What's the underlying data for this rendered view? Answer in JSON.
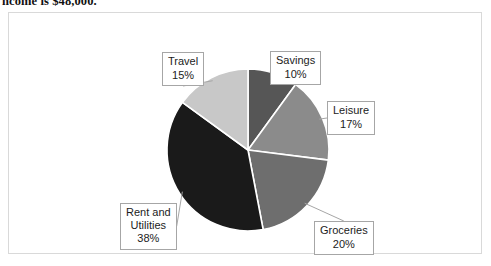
{
  "caption": {
    "text": "ncome is $48,000."
  },
  "figure": {
    "border_color": "#d9d9d9",
    "background": "#ffffff"
  },
  "chart_data": {
    "type": "pie",
    "title": "",
    "xlabel": "",
    "ylabel": "",
    "legend_position": "none",
    "grid": false,
    "start_angle_deg": 0,
    "direction": "clockwise",
    "units": "percent",
    "categories": [
      "Savings",
      "Leisure",
      "Groceries",
      "Rent and Utilities",
      "Travel"
    ],
    "values": [
      10,
      17,
      20,
      38,
      15
    ],
    "colors": [
      "#565656",
      "#8b8b8b",
      "#6e6e6e",
      "#1a1a1a",
      "#c8c8c8"
    ],
    "slices": [
      {
        "name": "Savings",
        "label_line1": "Savings",
        "label_line2": "10%",
        "value": 10,
        "color": "#565656",
        "start_deg": 0,
        "end_deg": 36
      },
      {
        "name": "Leisure",
        "label_line1": "Leisure",
        "label_line2": "17%",
        "value": 17,
        "color": "#8b8b8b",
        "start_deg": 36,
        "end_deg": 97.2
      },
      {
        "name": "Groceries",
        "label_line1": "Groceries",
        "label_line2": "20%",
        "value": 20,
        "color": "#6e6e6e",
        "start_deg": 97.2,
        "end_deg": 169.2
      },
      {
        "name": "Rent and Utilities",
        "label_line1": "Rent and",
        "label_line2": "Utilities",
        "label_line3": "38%",
        "value": 38,
        "color": "#1a1a1a",
        "start_deg": 169.2,
        "end_deg": 306
      },
      {
        "name": "Travel",
        "label_line1": "Travel",
        "label_line2": "15%",
        "value": 15,
        "color": "#c8c8c8",
        "start_deg": 306,
        "end_deg": 360
      }
    ],
    "geometry": {
      "center_x": 239,
      "center_y": 137,
      "radius": 81,
      "slice_separator_color": "#ffffff"
    }
  }
}
